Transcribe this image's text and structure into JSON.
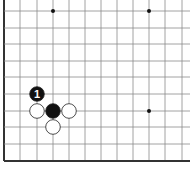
{
  "diagram": {
    "type": "go-board-fragment",
    "edges": [
      "left",
      "bottom"
    ],
    "colors": {
      "background": "#ffffff",
      "line": "#8a8a8a",
      "edge": "#333333",
      "black_stone": "#111111",
      "white_stone": "#ffffff",
      "stone_outline": "#222222",
      "number_on_black": "#ffffff"
    },
    "grid": {
      "x": [
        4,
        20,
        37,
        53,
        69,
        85,
        101,
        117,
        133,
        149,
        165,
        182
      ],
      "y": [
        11,
        28,
        44,
        61,
        77,
        94,
        111,
        127,
        144,
        161
      ]
    },
    "star_points": [
      {
        "col": 3,
        "row": 0
      },
      {
        "col": 9,
        "row": 0
      },
      {
        "col": 9,
        "row": 6
      }
    ],
    "stones": [
      {
        "color": "black",
        "col": 2,
        "row": 5,
        "label": "1"
      },
      {
        "color": "white",
        "col": 2,
        "row": 6,
        "label": ""
      },
      {
        "color": "black",
        "col": 3,
        "row": 6,
        "label": ""
      },
      {
        "color": "white",
        "col": 4,
        "row": 6,
        "label": ""
      },
      {
        "color": "white",
        "col": 3,
        "row": 7,
        "label": ""
      }
    ]
  }
}
